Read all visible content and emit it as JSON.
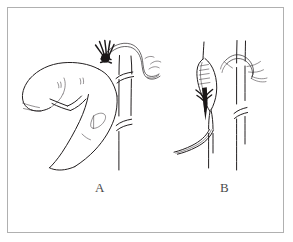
{
  "figure": {
    "title": "",
    "caption": "",
    "type": "line-art-medical-illustration",
    "width": 293,
    "height": 242,
    "background_color": "#ffffff",
    "ink_color": "#231f20",
    "frame_color": "#b0b0b0",
    "label_color": "#4a4a4a"
  },
  "panels": [
    {
      "id": "A",
      "label": "A",
      "subject": "hand-pinching-vessel-with-suture",
      "description": "A hand with thumb and index finger pinching a blood vessel while a suture thread with a dark knot bundle is drawn over it; the vessel runs vertically with interruption break marks."
    },
    {
      "id": "B",
      "label": "B",
      "subject": "cannulated-vessel-with-ligature",
      "description": "A vessel opened with a cannula inserted, shown with hatch marks along the cannula body and a dark arrow tip; catheter tubing exits at lower left. A second vessel at right carries a tied ligature loop and interruption break marks."
    }
  ],
  "labels": {
    "a": "A",
    "b": "B"
  }
}
